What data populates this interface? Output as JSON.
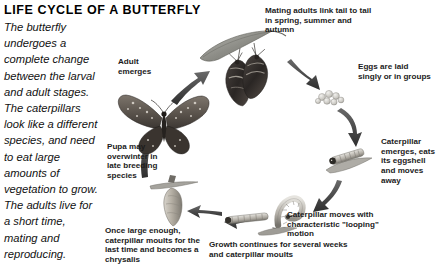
{
  "title": "LIFE CYCLE OF A BUTTERFLY",
  "intro": "The butterfly undergoes a complete change between the larval and adult stages. The caterpillars look like a different species, and need to eat large amounts of vegetation to grow. The adults live for a short time, mating and reproducing.",
  "captions": {
    "mating": "Mating adults link tail to tail in spring, summer and autumn",
    "eggs": "Eggs are laid singly or in groups",
    "caterpillar_emerges": "Caterpillar emerges, eats its eggshell and moves away",
    "looping": "Caterpillar moves with characteristic \"looping\" motion",
    "growth": "Growth continues for several weeks and caterpillar moults",
    "chrysalis": "Once large enough, caterpillar moults for the last time and becomes a chrysalis",
    "pupa": "Pupa may overwinter in late breeding species",
    "adult": "Adult emerges"
  },
  "figures": {
    "mating_adults": "mating-butterflies-on-leaf-figure",
    "eggs_cluster": "butterfly-eggs-cluster-figure",
    "young_caterpillar": "young-caterpillar-on-leaf-figure",
    "looping_caterpillar": "looping-caterpillar-figure",
    "grown_caterpillar": "grown-caterpillar-figure",
    "chrysalis": "chrysalis-hanging-from-twig-figure",
    "adult_butterfly": "adult-butterfly-wings-open-figure"
  },
  "arrows": {
    "to_eggs": "arrow-mating-to-eggs",
    "eggs_to_caterpillar": "arrow-eggs-to-caterpillar",
    "caterpillar_to_looping": "arrow-caterpillar-to-looping",
    "looping_to_growth": "arrow-looping-to-growth",
    "growth_to_chrysalis": "arrow-growth-to-chrysalis",
    "chrysalis_to_adult": "arrow-chrysalis-to-adult",
    "adult_to_mating": "arrow-adult-to-mating"
  },
  "colors": {
    "text": "#1a1a1a",
    "arrow_dark": "#3b3b3b",
    "arrow_mid": "#5d5d5d",
    "leaf_grey": "#9a9a96",
    "background": "#ffffff"
  }
}
